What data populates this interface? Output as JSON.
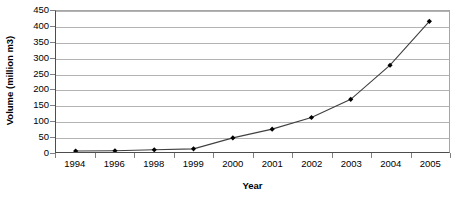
{
  "chart_data": {
    "type": "line",
    "title": "",
    "xlabel": "Year",
    "ylabel": "Volume (million m3)",
    "categories": [
      "1994",
      "1996",
      "1998",
      "1999",
      "2000",
      "2001",
      "2002",
      "2003",
      "2004",
      "2005"
    ],
    "values": [
      3,
      4,
      7,
      10,
      45,
      73,
      110,
      168,
      277,
      417
    ],
    "series": [
      {
        "name": "Volume",
        "values": [
          3,
          4,
          7,
          10,
          45,
          73,
          110,
          168,
          277,
          417
        ]
      }
    ],
    "ylim": [
      0,
      450
    ],
    "ytick_step": 50,
    "yticks": [
      0,
      50,
      100,
      150,
      200,
      250,
      300,
      350,
      400,
      450
    ],
    "ytick_labels": [
      "0",
      "50",
      "100",
      "150",
      "200",
      "250",
      "300",
      "350",
      "400",
      "450"
    ],
    "grid": "horizontal",
    "legend": "none",
    "marker": "diamond",
    "line_color": "#404040",
    "marker_color": "#000000",
    "grid_color": "#b3b3b3",
    "axis_color": "#4d4d4d",
    "background": "#ffffff"
  }
}
